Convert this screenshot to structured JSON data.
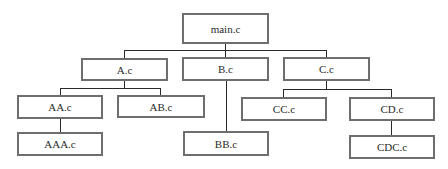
{
  "diagram": {
    "type": "file-include-tree",
    "root": "main.c",
    "nodes": {
      "main": {
        "label": "main.c",
        "x": 182,
        "y": 13,
        "w": 87,
        "h": 31
      },
      "a": {
        "label": "A.c",
        "x": 81,
        "y": 58,
        "w": 87,
        "h": 23
      },
      "b": {
        "label": "B.c",
        "x": 182,
        "y": 57,
        "w": 87,
        "h": 24
      },
      "c": {
        "label": "C.c",
        "x": 283,
        "y": 57,
        "w": 87,
        "h": 24
      },
      "aa": {
        "label": "AA.c",
        "x": 17,
        "y": 95,
        "w": 86,
        "h": 24
      },
      "ab": {
        "label": "AB.c",
        "x": 117,
        "y": 95,
        "w": 88,
        "h": 23
      },
      "aaa": {
        "label": "AAA.c",
        "x": 17,
        "y": 132,
        "w": 86,
        "h": 24
      },
      "bb": {
        "label": "BB.c",
        "x": 183,
        "y": 131,
        "w": 86,
        "h": 25
      },
      "cc": {
        "label": "CC.c",
        "x": 241,
        "y": 97,
        "w": 86,
        "h": 24
      },
      "cd": {
        "label": "CD.c",
        "x": 349,
        "y": 97,
        "w": 86,
        "h": 24
      },
      "cdc": {
        "label": "CDC.c",
        "x": 349,
        "y": 135,
        "w": 86,
        "h": 24
      }
    },
    "edges": [
      {
        "from": "main.c",
        "to": "A.c"
      },
      {
        "from": "main.c",
        "to": "B.c"
      },
      {
        "from": "main.c",
        "to": "C.c"
      },
      {
        "from": "A.c",
        "to": "AA.c"
      },
      {
        "from": "A.c",
        "to": "AB.c"
      },
      {
        "from": "AA.c",
        "to": "AAA.c"
      },
      {
        "from": "B.c",
        "to": "BB.c"
      },
      {
        "from": "C.c",
        "to": "CC.c"
      },
      {
        "from": "C.c",
        "to": "CD.c"
      },
      {
        "from": "CD.c",
        "to": "CDC.c"
      }
    ],
    "colors": {
      "border": "#6e6e6e",
      "connector": "#2a2a2a",
      "text": "#2b2b2b",
      "background": "#ffffff"
    }
  }
}
